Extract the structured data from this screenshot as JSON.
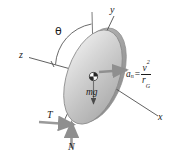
{
  "figure": {
    "axes": {
      "z_label": "z",
      "y_label": "y",
      "x_label": "x"
    },
    "angle": {
      "theta_label": "θ"
    },
    "forces": {
      "weight_label": "mg",
      "tension_label": "T",
      "normal_label": "N"
    },
    "acceleration": {
      "symbol": "a",
      "subscript": "n",
      "equals": "=",
      "numerator": "v",
      "numerator_exponent": "2",
      "denominator": "r",
      "denominator_subscript": "G"
    },
    "colors": {
      "disk_light": "#e3e3e3",
      "disk_mid": "#c9c9c9",
      "disk_dark": "#a8a8a8",
      "line": "#555555",
      "arrow": "#888888",
      "text": "#1a1a1a",
      "background": "#ffffff"
    }
  }
}
